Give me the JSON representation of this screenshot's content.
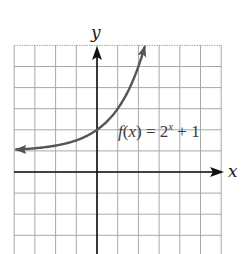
{
  "chart_data": {
    "type": "line",
    "title": "",
    "function": "f(x) = 2^x + 1",
    "xlabel": "x",
    "ylabel": "y",
    "xlim": [
      -4,
      6
    ],
    "ylim": [
      -4,
      6
    ],
    "grid": true,
    "grid_step": 1,
    "tick_labels": false,
    "asymptote": {
      "type": "horizontal",
      "y": 1
    },
    "y_intercept": [
      0,
      2
    ],
    "series": [
      {
        "name": "f(x) = 2^x + 1",
        "color": "#555555",
        "x": [
          -3.9,
          -3,
          -2,
          -1,
          0,
          1,
          2,
          2.3
        ],
        "y": [
          1.07,
          1.125,
          1.25,
          1.5,
          2,
          3,
          5,
          5.92
        ],
        "arrows": "both-ends"
      }
    ],
    "annotations": [
      {
        "text": "f(x) = 2^x + 1",
        "position": [
          1,
          2
        ]
      }
    ]
  },
  "labels": {
    "x_axis": "x",
    "y_axis": "y",
    "fn_f": "f",
    "fn_open": "(",
    "fn_var": "x",
    "fn_close": ")",
    "fn_eq": " = 2",
    "fn_exp": "x",
    "fn_tail": " + 1"
  },
  "colors": {
    "grid": "#a8a8a8",
    "axes": "#111111",
    "curve": "#555555",
    "background": "#ffffff"
  }
}
